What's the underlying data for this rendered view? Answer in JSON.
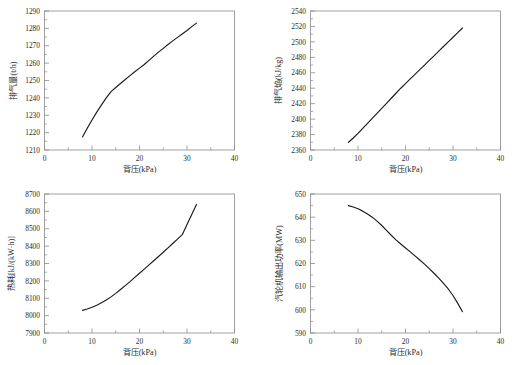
{
  "figure": {
    "background": "#ffffff",
    "line_color": "#1a1a1a",
    "axis_color": "#8a8a8a",
    "text_color": "#2b2b2b",
    "caption": ""
  },
  "shared": {
    "xlabel": "背压(kPa)",
    "xticks": [
      "0",
      "10",
      "20",
      "30",
      "40"
    ],
    "xlim": [
      0,
      40
    ]
  },
  "chart_data": [
    {
      "type": "line",
      "position": "top-left",
      "title": "",
      "xlabel": "背压(kPa)",
      "ylabel": "排气量(t/h)",
      "xlim": [
        0,
        40
      ],
      "ylim": [
        1210,
        1290
      ],
      "xticks": [
        "0",
        "10",
        "20",
        "30",
        "40"
      ],
      "yticks": [
        "1210",
        "1220",
        "1230",
        "1240",
        "1250",
        "1260",
        "1270",
        "1280",
        "1290"
      ],
      "grid": false,
      "legend": null,
      "x": [
        8.0,
        9.0,
        10.0,
        11.0,
        12.0,
        13.0,
        14.0,
        15.0,
        16.0,
        17.0,
        18.0,
        19.0,
        20.0,
        21.0,
        22.0,
        23.0,
        24.0,
        25.0,
        26.0,
        27.0,
        28.0,
        29.0,
        30.0,
        31.0,
        32.0
      ],
      "y": [
        1217.5,
        1222.5,
        1227.3,
        1231.8,
        1236.0,
        1240.0,
        1243.6,
        1246.0,
        1248.3,
        1250.6,
        1252.8,
        1255.0,
        1257.1,
        1259.2,
        1261.6,
        1264.0,
        1266.3,
        1268.5,
        1270.7,
        1272.8,
        1274.8,
        1276.8,
        1278.8,
        1281.0,
        1283.0
      ]
    },
    {
      "type": "line",
      "position": "top-right",
      "title": "",
      "xlabel": "背压(kPa)",
      "ylabel": "排气焔(kJ/kg)",
      "xlim": [
        0,
        40
      ],
      "ylim": [
        2360,
        2540
      ],
      "xticks": [
        "0",
        "10",
        "20",
        "30",
        "40"
      ],
      "yticks": [
        "2360",
        "2380",
        "2400",
        "2420",
        "2440",
        "2460",
        "2480",
        "2500",
        "2520",
        "2540"
      ],
      "grid": false,
      "legend": null,
      "x": [
        8.0,
        9.0,
        10.0,
        11.0,
        12.0,
        13.0,
        14.0,
        15.0,
        16.0,
        17.0,
        18.0,
        19.0,
        20.0,
        21.0,
        22.0,
        23.0,
        24.0,
        25.0,
        26.0,
        27.0,
        28.0,
        29.0,
        30.0,
        31.0,
        32.0
      ],
      "y": [
        2370.0,
        2375.5,
        2381.5,
        2388.0,
        2394.5,
        2401.0,
        2407.5,
        2414.0,
        2420.5,
        2427.0,
        2433.5,
        2440.0,
        2446.0,
        2452.0,
        2458.0,
        2464.0,
        2470.0,
        2476.0,
        2482.0,
        2488.0,
        2494.0,
        2500.0,
        2506.0,
        2512.0,
        2518.0
      ]
    },
    {
      "type": "line",
      "position": "bottom-left",
      "title": "",
      "xlabel": "背压(kPa)",
      "ylabel": "热耗[kJ/(kW·h)]",
      "xlim": [
        0,
        40
      ],
      "ylim": [
        7900,
        8700
      ],
      "xticks": [
        "0",
        "10",
        "20",
        "30",
        "40"
      ],
      "yticks": [
        "7900",
        "8000",
        "8100",
        "8200",
        "8300",
        "8400",
        "8500",
        "8600",
        "8700"
      ],
      "grid": false,
      "legend": null,
      "x": [
        8.0,
        9.0,
        10.0,
        11.0,
        12.0,
        13.0,
        14.0,
        15.0,
        16.0,
        17.0,
        18.0,
        19.0,
        20.0,
        21.0,
        22.0,
        23.0,
        24.0,
        25.0,
        26.0,
        27.0,
        28.0,
        29.0,
        30.0,
        31.0,
        32.0
      ],
      "y": [
        8030.0,
        8038.0,
        8048.0,
        8060.0,
        8074.0,
        8090.0,
        8108.0,
        8128.0,
        8150.0,
        8173.0,
        8196.0,
        8220.0,
        8244.0,
        8268.0,
        8292.0,
        8316.0,
        8340.0,
        8365.0,
        8390.0,
        8415.0,
        8440.0,
        8466.0,
        8525.0,
        8582.0,
        8640.0
      ]
    },
    {
      "type": "line",
      "position": "bottom-right",
      "title": "",
      "xlabel": "背压(kPa)",
      "ylabel": "汽轮机输出功率(MW)",
      "xlim": [
        0,
        40
      ],
      "ylim": [
        590,
        650
      ],
      "xticks": [
        "0",
        "10",
        "20",
        "30",
        "40"
      ],
      "yticks": [
        "590",
        "600",
        "610",
        "620",
        "630",
        "640",
        "650"
      ],
      "grid": false,
      "legend": null,
      "x": [
        8.0,
        9.0,
        10.0,
        11.0,
        12.0,
        13.0,
        14.0,
        15.0,
        16.0,
        17.0,
        18.0,
        19.0,
        20.0,
        21.0,
        22.0,
        23.0,
        24.0,
        25.0,
        26.0,
        27.0,
        28.0,
        29.0,
        30.0,
        31.0,
        32.0
      ],
      "y": [
        645.0,
        644.4,
        643.6,
        642.6,
        641.4,
        640.0,
        638.3,
        636.4,
        634.3,
        632.2,
        630.2,
        628.4,
        626.7,
        625.0,
        623.3,
        621.5,
        619.7,
        617.8,
        615.8,
        613.7,
        611.4,
        609.0,
        606.2,
        602.8,
        599.2
      ]
    }
  ]
}
